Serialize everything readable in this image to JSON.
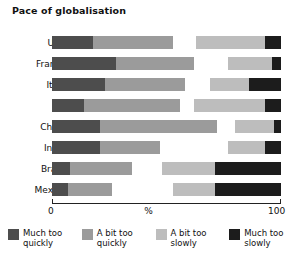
{
  "chart_data": {
    "type": "bar",
    "subtype": "stacked-horizontal-diverging",
    "title": "Pace of globalisation",
    "xlabel": "%",
    "ylabel": "",
    "xlim": [
      0,
      100
    ],
    "xticks": [
      0,
      100
    ],
    "xtick_labels": [
      "0",
      "100"
    ],
    "grid": false,
    "legend_position": "bottom",
    "categories": [
      "USA",
      "France",
      "Italy",
      "UK",
      "China",
      "India",
      "Brazil",
      "Mexico"
    ],
    "series": [
      {
        "name": "Much too quickly",
        "color": "#4d4d4d",
        "values": [
          18,
          28,
          23,
          14,
          21,
          21,
          8,
          7
        ]
      },
      {
        "name": "A bit too quickly",
        "color": "#9b9b9b",
        "values": [
          35,
          34,
          35,
          42,
          51,
          26,
          27,
          19
        ]
      },
      {
        "name": "A bit too slowly",
        "color": "#bdbdbd",
        "values": [
          30,
          19,
          17,
          31,
          17,
          16,
          23,
          18
        ]
      },
      {
        "name": "Much too slowly",
        "color": "#1c1c1c",
        "values": [
          7,
          4,
          14,
          7,
          3,
          7,
          29,
          29
        ]
      }
    ],
    "gap_before_third_segment": [
      10,
      15,
      11,
      6,
      8,
      30,
      13,
      27
    ]
  },
  "axis": {
    "min_label": "0",
    "max_label": "100",
    "unit_label": "%"
  },
  "legend": {
    "items": [
      {
        "label": "Much too\nquickly",
        "color": "#4d4d4d"
      },
      {
        "label": "A bit too\nquickly",
        "color": "#9b9b9b"
      },
      {
        "label": "A bit too\nslowly",
        "color": "#bdbdbd"
      },
      {
        "label": "Much too\nslowly",
        "color": "#1c1c1c"
      }
    ]
  }
}
